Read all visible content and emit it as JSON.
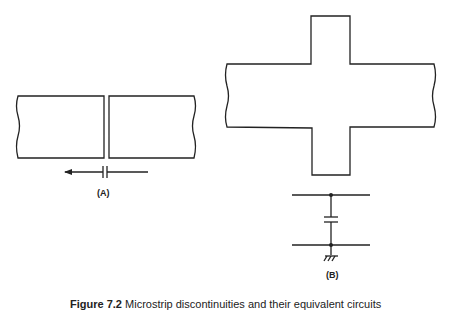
{
  "figure": {
    "panel_a": {
      "label": "(A)",
      "description": "Two rectangular strip sections separated by a gap, with series capacitor equivalent and arrow"
    },
    "panel_b": {
      "label": "(B)",
      "description": "Cross-shaped strip junction with shunt capacitor to ground equivalent"
    },
    "caption": {
      "prefix": "Figure 7.2",
      "text": "Microstrip discontinuities and their equivalent circuits"
    }
  }
}
